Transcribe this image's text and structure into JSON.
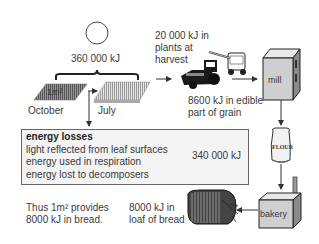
{
  "diagram": {
    "sun": {
      "energy_label": "360 000 kJ"
    },
    "field": {
      "area_label": "1m²",
      "months": [
        "October",
        "July"
      ]
    },
    "harvest": {
      "label_lines": [
        "20 000 kJ in",
        "plants at",
        "harvest"
      ]
    },
    "grain": {
      "label_lines": [
        "8600 kJ in edible",
        "part of grain"
      ]
    },
    "mill": {
      "label": "mill"
    },
    "flour": {
      "label": "FLOUR"
    },
    "bakery": {
      "label": "bakery"
    },
    "bread": {
      "label_lines": [
        "8000 kJ in",
        "loaf of bread"
      ]
    },
    "losses": {
      "title": "energy losses",
      "items": [
        "light reflected from leaf surfaces",
        "energy used in respiration",
        "energy lost to decomposers"
      ],
      "total": "340 000 kJ"
    },
    "conclusion": {
      "lines": [
        "Thus 1m² provides",
        "8000 kJ in bread."
      ]
    },
    "colors": {
      "line": "#333333",
      "box_fill": "#f4f4f4",
      "building_fill": "#d6d6d6",
      "field_dark": "#777777",
      "field_light": "#bdbdbd"
    }
  }
}
